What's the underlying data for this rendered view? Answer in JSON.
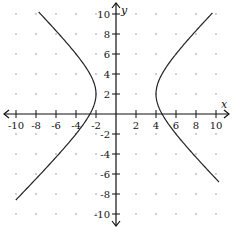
{
  "chart_data": {
    "type": "line",
    "title": "",
    "xlabel": "x",
    "ylabel": "y",
    "xlim": [
      -10,
      10
    ],
    "ylim": [
      -10,
      10
    ],
    "grid": "dots",
    "x_ticks": [
      -10,
      -8,
      -6,
      -4,
      -2,
      2,
      4,
      6,
      8,
      10
    ],
    "y_ticks": [
      10,
      8,
      6,
      4,
      2,
      -2,
      -4,
      -6,
      -8,
      -10
    ],
    "x_tick_labels": [
      "-10",
      "-8",
      "-6",
      "-4",
      "-2",
      "2",
      "4",
      "6",
      "8",
      "10"
    ],
    "y_tick_labels": [
      "10",
      "8",
      "6",
      "4",
      "2",
      "-2",
      "-4",
      "-6",
      "-8",
      "-10"
    ],
    "equation": "(x-1)^2/9 - (y-2)^2/9 = 1",
    "center": [
      1,
      2
    ],
    "vertices": [
      [
        -2,
        2
      ],
      [
        4,
        2
      ]
    ],
    "series": [
      {
        "name": "left-branch",
        "y_range": [
          -8.6,
          10.2
        ],
        "points": [
          [
            -7.8,
            10.2
          ],
          [
            -6.2,
            8
          ],
          [
            -4.4,
            6
          ],
          [
            -2.7,
            4
          ],
          [
            -2.0,
            2
          ],
          [
            -2.7,
            0
          ],
          [
            -4.4,
            -2
          ],
          [
            -6.2,
            -4
          ],
          [
            -8.2,
            -6
          ],
          [
            -10.3,
            -8.6
          ]
        ]
      },
      {
        "name": "right-branch",
        "y_range": [
          -6.8,
          10.1
        ],
        "points": [
          [
            9.7,
            10.1
          ],
          [
            8.2,
            8
          ],
          [
            6.4,
            6
          ],
          [
            4.7,
            4
          ],
          [
            4.0,
            2
          ],
          [
            4.7,
            0
          ],
          [
            6.4,
            -2
          ],
          [
            8.2,
            -4
          ],
          [
            10.1,
            -6.8
          ]
        ]
      }
    ]
  },
  "axes": {
    "x_label": "x",
    "y_label": "y"
  }
}
